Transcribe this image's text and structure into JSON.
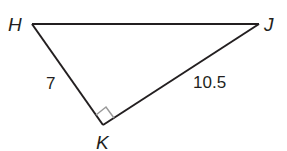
{
  "figure": {
    "type": "right-triangle",
    "vertices": [
      {
        "name": "H",
        "x": 32,
        "y": 24
      },
      {
        "name": "J",
        "x": 259,
        "y": 24
      },
      {
        "name": "K",
        "x": 103,
        "y": 125
      }
    ],
    "right_angle_at": "K",
    "side_labels": {
      "HK": "7",
      "KJ": "10.5"
    },
    "colors": {
      "stroke": "#231f20",
      "right_angle_mark": "#9a9a9a"
    }
  },
  "labels": {
    "H": "H",
    "J": "J",
    "K": "K",
    "side_HK": "7",
    "side_KJ": "10.5"
  }
}
